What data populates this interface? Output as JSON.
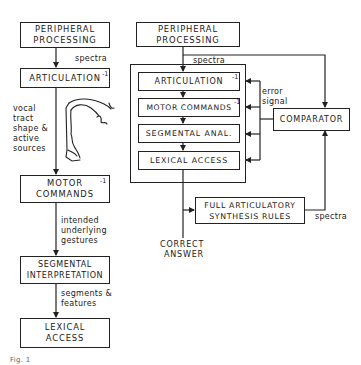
{
  "left_diagram": {
    "boxes": {
      "peripheral": "PERIPHERAL PROCESSING",
      "articulation": "ARTICULATION",
      "articulation_sup": "-1",
      "motor": "MOTOR COMMANDS",
      "motor_sup": "-1",
      "segmental": "SEGMENTAL INTERPRETATION",
      "lexical": "LEXICAL ACCESS"
    },
    "edge_labels": {
      "spectra": "spectra",
      "vocal_1": "vocal",
      "vocal_2": "tract",
      "vocal_3": "shape &",
      "vocal_4": "active",
      "vocal_5": "sources",
      "gest_1": "intended",
      "gest_2": "underlying",
      "gest_3": "gestures",
      "seg_1": "segments &",
      "seg_2": "features"
    },
    "illustration": "vocal-tract-sketch"
  },
  "right_diagram": {
    "boxes": {
      "peripheral": "PERIPHERAL PROCESSING",
      "articulation": "ARTICULATION",
      "articulation_sup": "-1",
      "motor": "MOTOR COMMANDS",
      "motor_sup": "-1",
      "segmental": "SEGMENTAL ANAL.",
      "lexical": "LEXICAL ACCESS",
      "comparator": "COMPARATOR",
      "synthesis": "FULL ARTICULATORY SYNTHESIS RULES"
    },
    "edge_labels": {
      "spectra_top": "spectra",
      "error_1": "error",
      "error_2": "signal",
      "spectra_bottom": "spectra",
      "correct_1": "CORRECT",
      "correct_2": "ANSWER"
    }
  },
  "caption": "Fig. 1"
}
